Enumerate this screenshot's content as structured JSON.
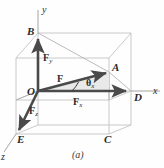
{
  "figure": {
    "caption": "(a)",
    "colors": {
      "vector": "#4a4a4a",
      "box_edge": "#b9b9b9",
      "box_edge_dark": "#9a9a9a",
      "axis": "#8f8f8f",
      "label": "#2b2b2b",
      "background": "#fefefe"
    }
  },
  "axes": [
    {
      "id": "y-axis",
      "label": "y"
    },
    {
      "id": "x-axis",
      "label": "x"
    },
    {
      "id": "z-axis",
      "label": "z"
    }
  ],
  "vertices": [
    {
      "id": "vertex-o",
      "label": "O"
    },
    {
      "id": "vertex-a",
      "label": "A"
    },
    {
      "id": "vertex-b",
      "label": "B"
    },
    {
      "id": "vertex-c",
      "label": "C"
    },
    {
      "id": "vertex-d",
      "label": "D"
    },
    {
      "id": "vertex-e",
      "label": "E"
    }
  ],
  "vectors": [
    {
      "id": "vector-f",
      "symbol": "F",
      "subscript": ""
    },
    {
      "id": "vector-fx",
      "symbol": "F",
      "subscript": "x"
    },
    {
      "id": "vector-fy",
      "symbol": "F",
      "subscript": "y"
    },
    {
      "id": "vector-fz",
      "symbol": "F",
      "subscript": "z"
    }
  ],
  "angle": {
    "symbol": "θ",
    "subscript": "x"
  }
}
